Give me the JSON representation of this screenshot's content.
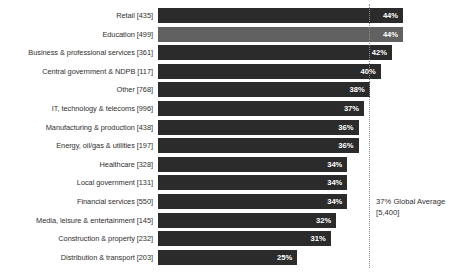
{
  "chart_data": {
    "type": "bar",
    "orientation": "horizontal",
    "title": "",
    "subtitle": "",
    "xlabel": "",
    "ylabel": "",
    "xlim": [
      0,
      50
    ],
    "grid": false,
    "legend": "none",
    "value_suffix": "%",
    "categories": [
      "Retail [435]",
      "Education [499]",
      "Business & professional services [361]",
      "Central government & NDPB [117]",
      "Other [768]",
      "IT, technology & telecoms [996]",
      "Manufacturing & production [438]",
      "Energy, oil/gas & utilities [197]",
      "Healthcare [328]",
      "Local government [131]",
      "Financial services [550]",
      "Media, leisure & entertainment [145]",
      "Construction & property [232]",
      "Distribution & transport [203]"
    ],
    "values": [
      44,
      44,
      42,
      40,
      38,
      37,
      36,
      36,
      34,
      34,
      34,
      32,
      31,
      25
    ],
    "value_labels": [
      "44%",
      "44%",
      "42%",
      "40%",
      "38%",
      "37%",
      "36%",
      "36%",
      "34%",
      "34%",
      "34%",
      "32%",
      "31%",
      "25%"
    ],
    "highlight_index": 1,
    "reference_line": {
      "value": 37,
      "label_line1": "37% Global Average",
      "label_line2": "[5,400]"
    },
    "colors": {
      "bar": "#2b2b2b",
      "bar_highlight": "#616161",
      "value_text": "#ffffff",
      "label_text": "#2f2f2f",
      "reference_line": "#8d8d8d",
      "background": "#ffffff"
    }
  }
}
